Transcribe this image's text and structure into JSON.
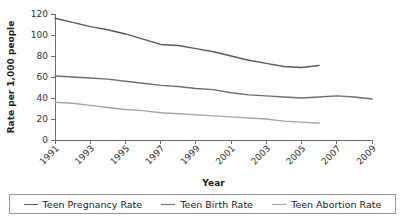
{
  "chart_data": {
    "type": "line",
    "title": "",
    "xlabel": "Year",
    "ylabel": "Rate per 1,000 people",
    "xlim": [
      1991,
      2009
    ],
    "ylim": [
      0,
      120
    ],
    "ytick_values": [
      0,
      20,
      40,
      60,
      80,
      100,
      120
    ],
    "ytick_labels": [
      "0",
      "20",
      "40",
      "60",
      "80",
      "100",
      "120"
    ],
    "xtick_values": [
      1991,
      1993,
      1995,
      1997,
      1999,
      2001,
      2003,
      2005,
      2007,
      2009
    ],
    "xtick_labels": [
      "1991",
      "1993",
      "1995",
      "1997",
      "1999",
      "2001",
      "2003",
      "2005",
      "2007",
      "2009"
    ],
    "grid": false,
    "legend_position": "bottom",
    "series": [
      {
        "name": "Teen Pregnancy Rate",
        "color": "#5a5a5a",
        "x": [
          1991,
          1992,
          1993,
          1994,
          1995,
          1996,
          1997,
          1998,
          1999,
          2000,
          2001,
          2002,
          2003,
          2004,
          2005,
          2006
        ],
        "values": [
          116,
          112,
          108,
          105,
          101,
          96,
          91,
          90,
          87,
          84,
          80,
          76,
          73,
          70,
          69,
          71
        ]
      },
      {
        "name": "Teen Birth Rate",
        "color": "#6e6e6e",
        "x": [
          1991,
          1992,
          1993,
          1994,
          1995,
          1996,
          1997,
          1998,
          1999,
          2000,
          2001,
          2002,
          2003,
          2004,
          2005,
          2006,
          2007,
          2008,
          2009
        ],
        "values": [
          61,
          60,
          59,
          58,
          56,
          54,
          52,
          51,
          49,
          48,
          45,
          43,
          42,
          41,
          40,
          41,
          42,
          41,
          39
        ]
      },
      {
        "name": "Teen Abortion Rate",
        "color": "#a6a6a6",
        "x": [
          1991,
          1992,
          1993,
          1994,
          1995,
          1996,
          1997,
          1998,
          1999,
          2000,
          2001,
          2002,
          2003,
          2004,
          2005,
          2006
        ],
        "values": [
          36,
          35,
          33,
          31,
          29,
          28,
          26,
          25,
          24,
          23,
          22,
          21,
          20,
          18,
          17,
          16
        ]
      }
    ]
  },
  "legend": {
    "items": [
      {
        "label": "Teen Pregnancy Rate",
        "color": "#5a5a5a"
      },
      {
        "label": "Teen Birth Rate",
        "color": "#6e6e6e"
      },
      {
        "label": "Teen Abortion Rate",
        "color": "#a6a6a6"
      }
    ]
  }
}
